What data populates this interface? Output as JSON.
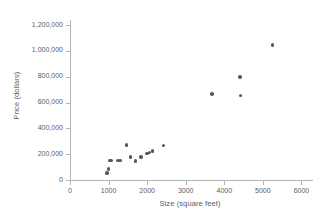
{
  "chart_data": {
    "type": "scatter",
    "title": "",
    "xlabel": "Size (square feet)",
    "ylabel": "Price (dollars)",
    "xlim": [
      0,
      6300
    ],
    "ylim": [
      0,
      1240000
    ],
    "xticks": [
      0,
      1000,
      2000,
      3000,
      4000,
      5000,
      6000
    ],
    "xtick_labels": [
      "0",
      "1000",
      "2000",
      "3000",
      "4000",
      "5000",
      "6000"
    ],
    "yticks": [
      0,
      200000,
      400000,
      600000,
      800000,
      1000000,
      1200000
    ],
    "ytick_labels": [
      "0",
      "200,000",
      "400,000",
      "600,000",
      "800,000",
      "1,000,000",
      "1,200,000"
    ],
    "grid": false,
    "legend": "none",
    "marker_color": "#575757",
    "axis_color": "#b4b4b4",
    "text_color": "#5d5d5d",
    "points": [
      {
        "x": 960,
        "y": 55000
      },
      {
        "x": 1000,
        "y": 85000
      },
      {
        "x": 1030,
        "y": 150000
      },
      {
        "x": 1080,
        "y": 150000
      },
      {
        "x": 1230,
        "y": 150000
      },
      {
        "x": 1290,
        "y": 150000
      },
      {
        "x": 1460,
        "y": 270000
      },
      {
        "x": 1570,
        "y": 180000
      },
      {
        "x": 1700,
        "y": 148000
      },
      {
        "x": 1840,
        "y": 180000
      },
      {
        "x": 1990,
        "y": 205000
      },
      {
        "x": 2060,
        "y": 212000
      },
      {
        "x": 2140,
        "y": 225000
      },
      {
        "x": 2420,
        "y": 268000
      },
      {
        "x": 3680,
        "y": 665000
      },
      {
        "x": 4400,
        "y": 798000
      },
      {
        "x": 4420,
        "y": 655000
      },
      {
        "x": 5250,
        "y": 1045000
      }
    ]
  }
}
